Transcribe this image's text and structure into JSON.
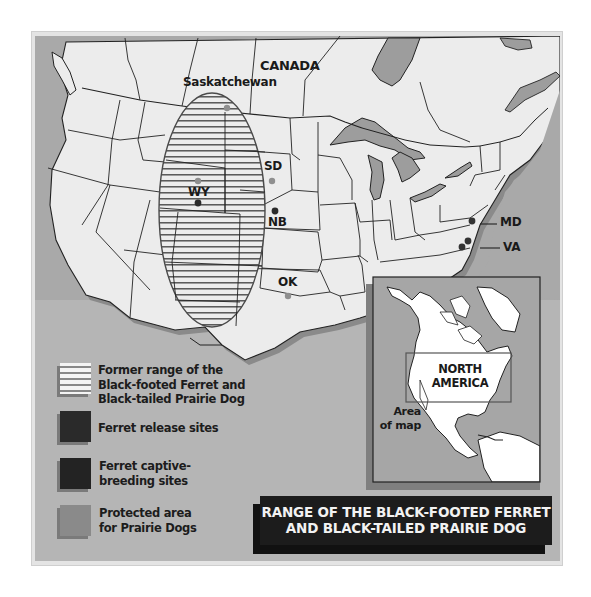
{
  "map": {
    "title_line1": "RANGE OF THE BLACK-FOOTED FERRET",
    "title_line2": "AND BLACK-TAILED PRAIRIE DOG",
    "region_labels": {
      "canada": "CANADA",
      "saskatchewan": "Saskatchewan"
    },
    "sites": [
      {
        "code": "WY",
        "markers": [
          "protected-area",
          "captive-breeding"
        ]
      },
      {
        "code": "SD",
        "markers": [
          "protected-area"
        ]
      },
      {
        "code": "NB",
        "markers": [
          "captive-breeding"
        ]
      },
      {
        "code": "OK",
        "markers": [
          "protected-area"
        ]
      },
      {
        "code": "MD",
        "markers": [
          "release-site"
        ]
      },
      {
        "code": "VA",
        "markers": [
          "release-site",
          "release-site"
        ]
      }
    ],
    "site_labels": {
      "wy": "WY",
      "sd": "SD",
      "nb": "NB",
      "ok": "OK",
      "md": "MD",
      "va": "VA"
    }
  },
  "legend": {
    "items": [
      {
        "id": "former-range",
        "line1": "Former range of the",
        "line2": "Black-footed Ferret and",
        "line3": "Black-tailed Prairie Dog",
        "swatch": "hatched"
      },
      {
        "id": "release-sites",
        "line1": "Ferret release sites",
        "swatch": "#2a2a2a"
      },
      {
        "id": "captive-breeding",
        "line1": "Ferret captive-",
        "line2": "breeding sites",
        "swatch": "#232323"
      },
      {
        "id": "protected-area",
        "line1": "Protected area",
        "line2": "for Prairie Dogs",
        "swatch": "#8a8a8a"
      }
    ]
  },
  "inset": {
    "label_line1": "NORTH",
    "label_line2": "AMERICA",
    "area_line1": "Area",
    "area_line2": "of map"
  },
  "colors": {
    "water": "#a9a9a9",
    "land": "#ececec",
    "lakes": "#9d9d9d",
    "border": "#222222",
    "release_site": "#333333",
    "captive_breeding": "#2a2a2a",
    "protected_area": "#8f8f8f",
    "title_bg": "#1c1c1c",
    "title_text": "#f2f2f2"
  }
}
